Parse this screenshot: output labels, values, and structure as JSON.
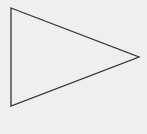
{
  "figure": {
    "shape": "triangle",
    "orientation": "right-pointing",
    "icon": "play-triangle-outline",
    "colors": {
      "background": "#efefef",
      "stroke": "#333333",
      "fill": "none"
    }
  }
}
